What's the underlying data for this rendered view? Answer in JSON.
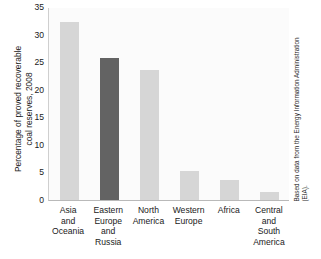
{
  "chart_data": {
    "type": "bar",
    "title": "",
    "xlabel": "",
    "ylabel": "Percentage of proved recoverable\ncoal reserves, 2008",
    "categories": [
      "Asia\nand\nOceania",
      "Eastern\nEurope\nand\nRussia",
      "North\nAmerica",
      "Western\nEurope",
      "Africa",
      "Central\nand\nSouth\nAmerica"
    ],
    "values": [
      32.2,
      25.8,
      23.5,
      5.3,
      3.7,
      1.4
    ],
    "ylim": [
      0,
      35
    ],
    "yticks": [
      0,
      5,
      10,
      15,
      20,
      25,
      30,
      35
    ],
    "ytick_labels": [
      "0",
      "5",
      "10",
      "15",
      "20",
      "25",
      "30",
      "35"
    ],
    "grid": false,
    "legend": "none",
    "bar_colors": [
      "#d6d6d6",
      "#636363",
      "#d6d6d6",
      "#d6d6d6",
      "#d6d6d6",
      "#d6d6d6"
    ],
    "highlight_index": 1,
    "annotations": [
      "Based on data from the Energy Information Administration\n(EIA)."
    ]
  },
  "source_note": "Based on data from the Energy Information Administration\n(EIA).",
  "colors": {
    "bar_light": "#d6d6d6",
    "bar_dark": "#636363",
    "plot_background": "#fbfbfb",
    "axis": "#b9b9b9",
    "text": "#1a1a1a"
  }
}
